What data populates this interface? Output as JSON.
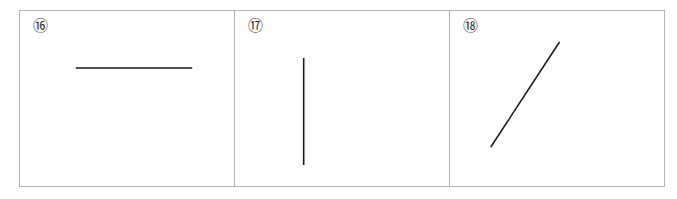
{
  "figure": {
    "background_color": "#ffffff",
    "frame_color": "#b4b4b4",
    "stroke_color": "#1a1a1a",
    "width": 677,
    "height": 199
  },
  "panels": [
    {
      "label": "⑯",
      "label_text": "10",
      "line_name": "horizontal-line",
      "orientation": "horizontal",
      "stroke_width": 1.6,
      "x1": 56,
      "y1": 57,
      "x2": 173,
      "y2": 57
    },
    {
      "label": "⑰",
      "label_text": "11",
      "line_name": "vertical-line",
      "orientation": "vertical",
      "stroke_width": 1.6,
      "x1": 69,
      "y1": 47,
      "x2": 69,
      "y2": 154
    },
    {
      "label": "⑱",
      "label_text": "12",
      "line_name": "diagonal-line",
      "orientation": "diagonal-up-right",
      "stroke_width": 1.6,
      "x1": 41,
      "y1": 136,
      "x2": 110,
      "y2": 31
    }
  ],
  "chart_data": {
    "type": "line",
    "title": "",
    "xlabel": "",
    "ylabel": "",
    "series": [
      {
        "name": "⑯ horizontal segment",
        "x": [
          56,
          173
        ],
        "y": [
          57,
          57
        ]
      },
      {
        "name": "⑰ vertical segment",
        "x": [
          69,
          69
        ],
        "y": [
          47,
          154
        ]
      },
      {
        "name": "⑱ diagonal segment",
        "x": [
          41,
          110
        ],
        "y": [
          136,
          31
        ]
      }
    ]
  }
}
